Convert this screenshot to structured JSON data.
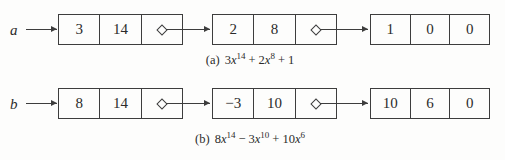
{
  "page": {
    "background": "#fdfdfc",
    "line_color": "#3d3d3d",
    "text_color": "#2b2b2b",
    "description_type": "linked-list polynomial representation diagram"
  },
  "lists": [
    {
      "label": "a",
      "nodes": [
        {
          "cells": [
            "3",
            "14"
          ],
          "pointer_icon": "diamond"
        },
        {
          "cells": [
            "2",
            "8"
          ],
          "pointer_icon": "diamond"
        },
        {
          "cells": [
            "1",
            "0",
            "0"
          ]
        }
      ],
      "caption": {
        "label": "(a)",
        "formula": [
          {
            "op": "",
            "coef": "3",
            "var": "x",
            "exp": "14"
          },
          {
            "op": "+",
            "coef": "2",
            "var": "x",
            "exp": "8"
          },
          {
            "op": "+",
            "coef": "1",
            "var": "",
            "exp": ""
          }
        ]
      }
    },
    {
      "label": "b",
      "nodes": [
        {
          "cells": [
            "8",
            "14"
          ],
          "pointer_icon": "diamond"
        },
        {
          "cells": [
            "−3",
            "10"
          ],
          "pointer_icon": "diamond"
        },
        {
          "cells": [
            "10",
            "6",
            "0"
          ]
        }
      ],
      "caption": {
        "label": "(b)",
        "formula": [
          {
            "op": "",
            "coef": "8",
            "var": "x",
            "exp": "14"
          },
          {
            "op": "−",
            "coef": "3",
            "var": "x",
            "exp": "10"
          },
          {
            "op": "+",
            "coef": "10",
            "var": "x",
            "exp": "6"
          }
        ]
      }
    }
  ]
}
